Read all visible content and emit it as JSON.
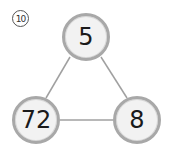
{
  "problem": {
    "number_label": "10"
  },
  "nodes": {
    "top": {
      "value": "5"
    },
    "bottom_left": {
      "value": "72"
    },
    "bottom_right": {
      "value": "8"
    }
  },
  "colors": {
    "edge": "#a0a0a0",
    "node_border": "#a8a8a8",
    "node_fill": "#f2f2f2"
  }
}
